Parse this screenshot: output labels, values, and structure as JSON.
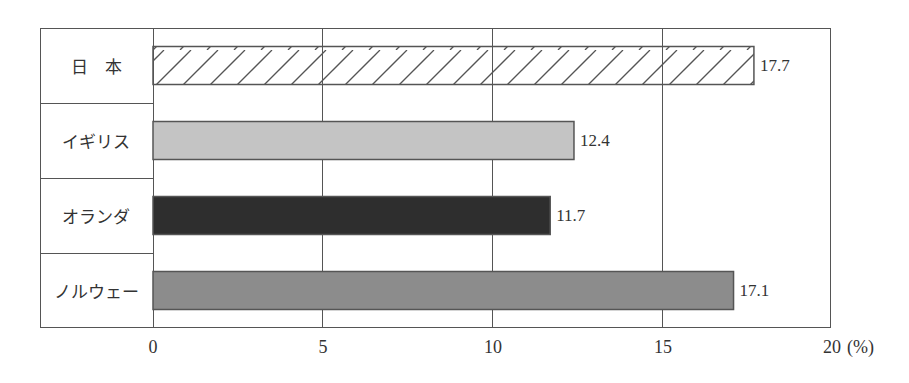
{
  "chart_data": {
    "type": "bar",
    "orientation": "horizontal",
    "title": "",
    "xlabel": "(%)",
    "ylabel": "",
    "categories": [
      "日　本",
      "イギリス",
      "オランダ",
      "ノルウェー"
    ],
    "values": [
      17.7,
      12.4,
      11.7,
      17.1
    ],
    "value_labels": [
      "17.7",
      "12.4",
      "11.7",
      "17.1"
    ],
    "bar_styles": [
      {
        "fill": "#ffffff",
        "pattern": "diagonal-hatch",
        "stroke": "#555555"
      },
      {
        "fill": "#c4c4c4",
        "pattern": "none",
        "stroke": "#555555"
      },
      {
        "fill": "#2e2e2e",
        "pattern": "none",
        "stroke": "#555555"
      },
      {
        "fill": "#8c8c8c",
        "pattern": "none",
        "stroke": "#555555"
      }
    ],
    "xlim": [
      0,
      20
    ],
    "x_ticks": [
      "0",
      "5",
      "10",
      "15",
      "20"
    ],
    "x_unit_label": "(%)",
    "grid": true,
    "legend": "none"
  }
}
